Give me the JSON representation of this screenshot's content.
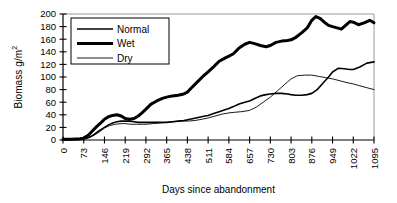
{
  "chart_data": {
    "type": "line",
    "title": "",
    "xlabel": "Days since abandonment",
    "ylabel": "Biomass g/m2",
    "ylabel_display": "Biomass g/m",
    "ylabel_exponent": "2",
    "xlim": [
      0,
      1095
    ],
    "ylim": [
      0,
      200
    ],
    "grid": false,
    "legend_position": "top-left",
    "xticks": [
      0,
      73,
      146,
      219,
      292,
      365,
      438,
      511,
      584,
      657,
      730,
      803,
      876,
      949,
      1022,
      1095
    ],
    "xtick_labels": [
      "0",
      "73",
      "146",
      "219",
      "292",
      "365",
      "438",
      "511",
      "584",
      "657",
      "730",
      "803",
      "876",
      "949",
      "1022",
      "1095"
    ],
    "yticks": [
      0,
      20,
      40,
      60,
      80,
      100,
      120,
      140,
      160,
      180,
      200
    ],
    "ytick_labels": [
      "0",
      "20",
      "40",
      "60",
      "80",
      "100",
      "120",
      "140",
      "160",
      "180",
      "200"
    ],
    "series": [
      {
        "name": "Normal",
        "color": "#000000",
        "line_width": 1.6,
        "x": [
          0,
          30,
          60,
          73,
          95,
          110,
          125,
          146,
          160,
          175,
          190,
          205,
          219,
          235,
          250,
          265,
          280,
          292,
          310,
          330,
          350,
          365,
          385,
          405,
          425,
          438,
          460,
          480,
          500,
          511,
          530,
          550,
          570,
          584,
          600,
          620,
          640,
          657,
          675,
          695,
          715,
          730,
          750,
          770,
          790,
          803,
          820,
          840,
          860,
          876,
          895,
          915,
          935,
          949,
          970,
          990,
          1010,
          1022,
          1045,
          1070,
          1095
        ],
        "y": [
          1,
          1,
          1,
          2,
          5,
          9,
          14,
          20,
          24,
          27,
          29,
          30,
          30,
          30,
          29,
          28,
          28,
          28,
          28,
          28,
          28,
          28,
          29,
          30,
          31,
          32,
          34,
          36,
          38,
          39,
          42,
          45,
          48,
          50,
          53,
          57,
          60,
          62,
          66,
          70,
          72,
          73,
          74,
          74,
          73,
          72,
          71,
          71,
          72,
          74,
          80,
          90,
          100,
          108,
          114,
          113,
          112,
          112,
          116,
          122,
          124
        ]
      },
      {
        "name": "Wet",
        "color": "#000000",
        "line_width": 3.0,
        "x": [
          0,
          30,
          60,
          73,
          90,
          105,
          120,
          135,
          146,
          160,
          175,
          190,
          205,
          219,
          235,
          250,
          265,
          280,
          292,
          310,
          330,
          350,
          365,
          385,
          405,
          425,
          438,
          455,
          475,
          495,
          511,
          530,
          550,
          570,
          584,
          600,
          620,
          640,
          657,
          675,
          695,
          715,
          730,
          750,
          770,
          790,
          803,
          820,
          840,
          860,
          876,
          890,
          905,
          920,
          935,
          949,
          965,
          980,
          995,
          1010,
          1022,
          1040,
          1060,
          1080,
          1095
        ],
        "y": [
          1,
          1,
          2,
          3,
          8,
          15,
          22,
          28,
          33,
          37,
          39,
          40,
          38,
          34,
          33,
          34,
          38,
          44,
          49,
          57,
          62,
          66,
          68,
          70,
          71,
          73,
          76,
          84,
          93,
          102,
          108,
          116,
          125,
          130,
          133,
          137,
          146,
          152,
          155,
          153,
          150,
          148,
          150,
          155,
          157,
          158,
          159,
          163,
          170,
          178,
          190,
          196,
          193,
          187,
          182,
          180,
          178,
          176,
          182,
          188,
          187,
          183,
          186,
          190,
          186
        ]
      },
      {
        "name": "Dry",
        "color": "#000000",
        "line_width": 0.9,
        "x": [
          0,
          30,
          60,
          73,
          95,
          115,
          135,
          146,
          165,
          185,
          205,
          219,
          240,
          260,
          280,
          292,
          315,
          340,
          365,
          390,
          415,
          438,
          465,
          490,
          511,
          535,
          560,
          584,
          605,
          630,
          657,
          680,
          705,
          730,
          755,
          780,
          803,
          825,
          850,
          876,
          900,
          925,
          949,
          975,
          1000,
          1022,
          1045,
          1070,
          1095
        ],
        "y": [
          1,
          1,
          1,
          1,
          4,
          9,
          15,
          19,
          23,
          25,
          26,
          26,
          25,
          25,
          25,
          25,
          26,
          27,
          28,
          29,
          30,
          30,
          31,
          33,
          35,
          38,
          41,
          43,
          44,
          45,
          47,
          52,
          60,
          68,
          78,
          88,
          97,
          102,
          103,
          103,
          101,
          99,
          97,
          94,
          91,
          89,
          86,
          83,
          80
        ]
      }
    ]
  },
  "legend": {
    "items": [
      {
        "label": "Normal",
        "swatch": "thin-line"
      },
      {
        "label": "Wet",
        "swatch": "thick-line"
      },
      {
        "label": "Dry",
        "swatch": "hairline"
      }
    ]
  }
}
